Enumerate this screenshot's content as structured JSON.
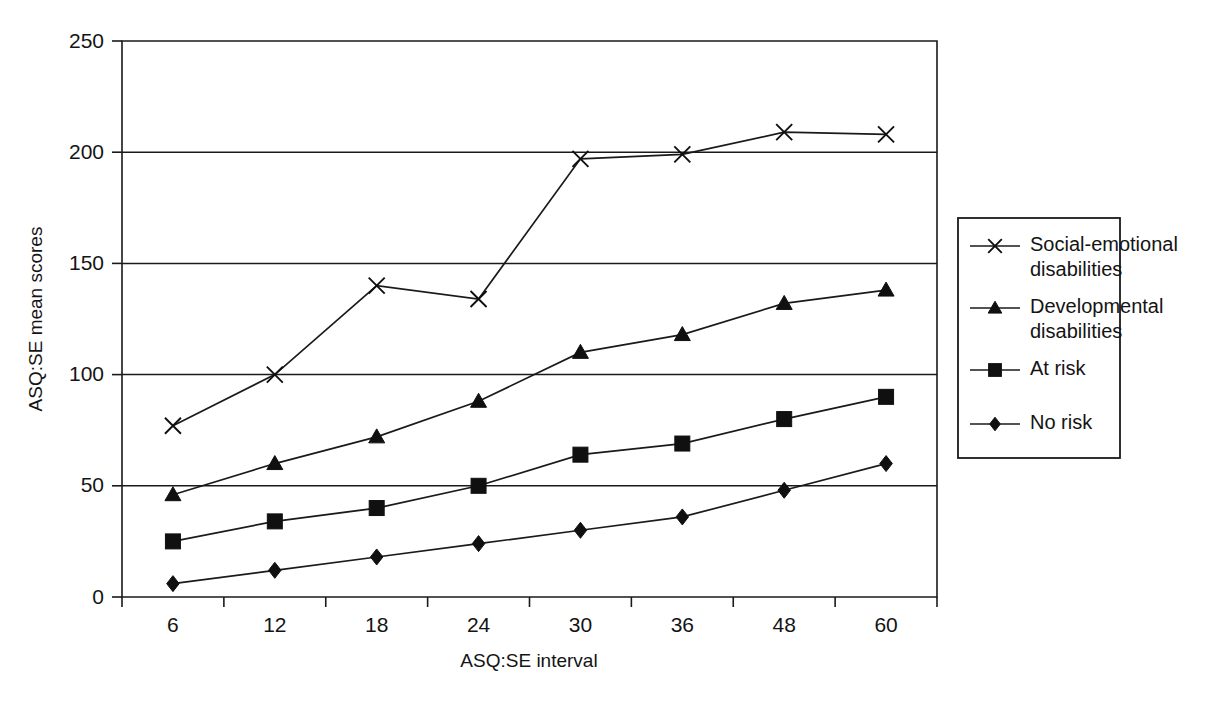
{
  "chart_data": {
    "type": "line",
    "title": "",
    "xlabel": "ASQ:SE interval",
    "ylabel": "ASQ:SE mean scores",
    "categories": [
      "6",
      "12",
      "18",
      "24",
      "30",
      "36",
      "48",
      "60"
    ],
    "ylim": [
      0,
      250
    ],
    "yticks": [
      "0",
      "50",
      "100",
      "150",
      "200",
      "250"
    ],
    "grid": "horizontal",
    "legend_position": "right",
    "series": [
      {
        "name": "Social-emotional disabilities",
        "marker": "cross",
        "values": [
          77,
          100,
          140,
          134,
          197,
          199,
          209,
          208
        ]
      },
      {
        "name": "Developmental disabilities",
        "marker": "triangle",
        "values": [
          46,
          60,
          72,
          88,
          110,
          118,
          132,
          138
        ]
      },
      {
        "name": "At risk",
        "marker": "square",
        "values": [
          25,
          34,
          40,
          50,
          64,
          69,
          80,
          90
        ]
      },
      {
        "name": "No risk",
        "marker": "diamond",
        "values": [
          6,
          12,
          18,
          24,
          30,
          36,
          48,
          60
        ]
      }
    ]
  },
  "legend": {
    "entries": [
      {
        "label_line1": "Social-emotional",
        "label_line2": "disabilities",
        "marker": "cross-marker"
      },
      {
        "label_line1": "Developmental",
        "label_line2": "disabilities",
        "marker": "triangle-marker"
      },
      {
        "label_line1": "At risk",
        "label_line2": "",
        "marker": "square-marker"
      },
      {
        "label_line1": "No risk",
        "label_line2": "",
        "marker": "diamond-marker"
      }
    ]
  },
  "colors": {
    "ink": "#1a1a1a",
    "background": "#ffffff"
  }
}
